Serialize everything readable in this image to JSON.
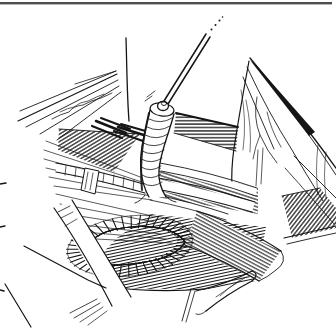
{
  "meta": {
    "image_type": "pen-and-ink surgical line illustration (no text in image)",
    "background_color": "#ffffff",
    "ink_color": "#151515",
    "top_border_color": "#4d4d4d"
  },
  "figure": {
    "description": "Black-and-white surgical illustration of an operative field: a fine catheter passes from the upper right (dotted continuation) into the open stump of a vessel at center; tissue flaps with small vessels are retracted to the upper left and right; below lies a dark crosshatched oval fenestration ringed by cut muscle fibers, horizontal cords with a small vessel loop, fanned muscle fibers to the left, and broad crossing muscle bands with a curled tip at the lower right.",
    "fenestration": {
      "cx": 130,
      "cy": 246,
      "rotation_deg": -7,
      "inner_rx": 48,
      "inner_ry": 17.5,
      "outer_rx": 64,
      "outer_ry": 30,
      "tick_count": 42
    },
    "elements": [
      {
        "name": "top-border-rule",
        "role": "figure frame line at top edge"
      },
      {
        "name": "margin-tick-marks",
        "role": "three small printed dashes on left margin"
      },
      {
        "name": "upper-left-flap",
        "role": "retracted tissue flap with wavy vessels"
      },
      {
        "name": "central-skin-flap",
        "role": "white retracted skin flap with hatched underside"
      },
      {
        "name": "catheter",
        "role": "thin catheter with dotted continuation off upper right"
      },
      {
        "name": "vessel-stump",
        "role": "shaded vessel tube the catheter enters"
      },
      {
        "name": "right-flap",
        "role": "triangular retracted flap with branching vessels"
      },
      {
        "name": "platysma-edge-band",
        "role": "hatched cut-edge band right of vessel"
      },
      {
        "name": "muscle-fan-left",
        "role": "fanned fine muscle fibers at left"
      },
      {
        "name": "ligated-cord",
        "role": "horizontal cord with small white vessel loop"
      },
      {
        "name": "center-cords",
        "role": "parallel cord bundles crossing the field"
      },
      {
        "name": "fenestration",
        "role": "dark crosshatched oval opening with radial cut-muscle rim"
      },
      {
        "name": "retractor-band",
        "role": "smooth white band at lower left"
      },
      {
        "name": "skin-edge-bottom",
        "role": "lower wound skin edges"
      },
      {
        "name": "muscle-mass-bottom",
        "role": "fibrous muscle mass with broad crossing band and curled tip"
      }
    ]
  }
}
